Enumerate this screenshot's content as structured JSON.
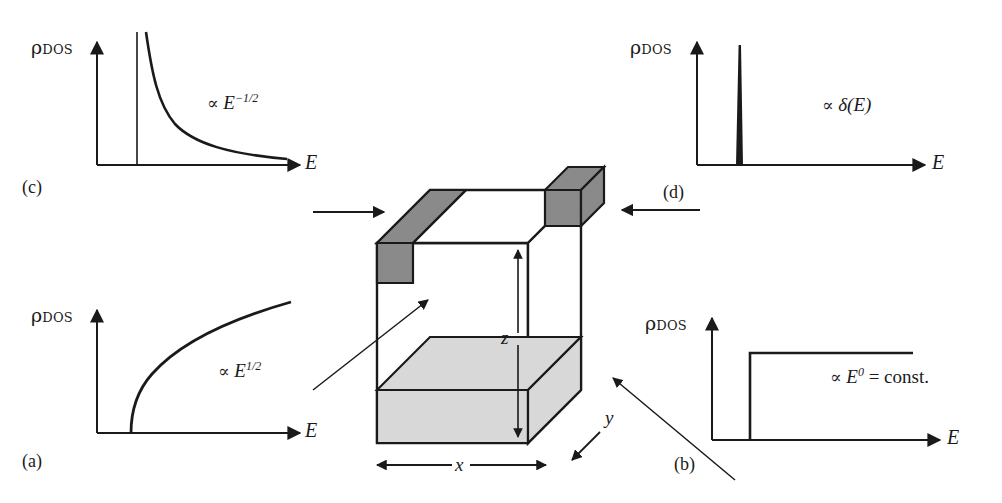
{
  "figure": {
    "type": "scientific-diagram",
    "axis_label_y": "ρ",
    "axis_label_y_sub": "DOS",
    "axis_label_x": "E"
  },
  "panels": [
    {
      "id": "a",
      "letter": "(a)",
      "dimensionality": "3D bulk",
      "relation_symbol": "∝",
      "relation_var": "E",
      "relation_exp": "1/2",
      "relation_text": "∝ E^1/2",
      "curve": "sqrt",
      "y_label": "ρ",
      "y_sub": "DOS",
      "x_label": "E"
    },
    {
      "id": "b",
      "letter": "(b)",
      "dimensionality": "2D quantum well",
      "relation_symbol": "∝",
      "relation_var": "E",
      "relation_exp": "0",
      "relation_tail": "= const.",
      "relation_text": "∝ E^0 = const.",
      "curve": "step",
      "y_label": "ρ",
      "y_sub": "DOS",
      "x_label": "E"
    },
    {
      "id": "c",
      "letter": "(c)",
      "dimensionality": "1D quantum wire",
      "relation_symbol": "∝",
      "relation_var": "E",
      "relation_exp": "−1/2",
      "relation_text": "∝ E^−1/2",
      "curve": "inverse-sqrt",
      "y_label": "ρ",
      "y_sub": "DOS",
      "x_label": "E"
    },
    {
      "id": "d",
      "letter": "(d)",
      "dimensionality": "0D quantum dot",
      "relation_symbol": "∝",
      "relation_var": "δ(E)",
      "relation_text": "∝ δ(E)",
      "curve": "delta",
      "y_label": "ρ",
      "y_sub": "DOS",
      "x_label": "E"
    }
  ],
  "cube": {
    "dimension_labels": [
      "x",
      "y",
      "z"
    ],
    "x_label": "x",
    "y_label": "y",
    "z_label": "z",
    "features": [
      {
        "name": "bulk-cube",
        "fill": "#ffffff"
      },
      {
        "name": "quantum-well-slab",
        "fill": "#d8d8d8"
      },
      {
        "name": "quantum-wire-bar",
        "fill": "#8a8a8a"
      },
      {
        "name": "quantum-dot-cube",
        "fill": "#8a8a8a"
      }
    ]
  },
  "colors": {
    "ink": "#1a1a1a",
    "well_fill": "#d8d8d8",
    "wire_fill": "#8a8a8a",
    "dot_fill": "#8a8a8a",
    "background": "#ffffff"
  }
}
